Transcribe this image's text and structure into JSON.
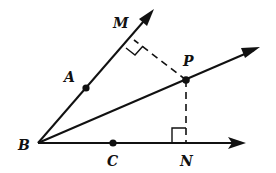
{
  "diagram": {
    "type": "geometry-angle-bisector",
    "points": {
      "B": {
        "label": "B",
        "role": "vertex"
      },
      "A": {
        "label": "A",
        "role": "point on ray BM"
      },
      "M": {
        "label": "M",
        "role": "foot of perpendicular from P to ray BA"
      },
      "P": {
        "label": "P",
        "role": "point on bisector ray"
      },
      "C": {
        "label": "C",
        "role": "point on ray BN"
      },
      "N": {
        "label": "N",
        "role": "foot of perpendicular from P to ray BC"
      }
    },
    "rays": [
      "BM",
      "BP",
      "BN"
    ],
    "dashed_segments": [
      "PM",
      "PN"
    ],
    "right_angles": [
      "PMB",
      "PNB"
    ],
    "colors": {
      "ink": "#111111",
      "background": "#ffffff"
    }
  }
}
